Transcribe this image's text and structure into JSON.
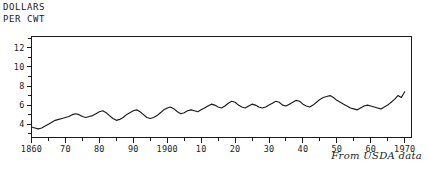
{
  "figure": {
    "axis_title_line1": "DOLLARS",
    "axis_title_line2": "PER CWT",
    "caption": "From USDA data"
  },
  "chart_data": {
    "type": "line",
    "title": "",
    "subtitle": "",
    "xlabel": "",
    "ylabel": "DOLLARS PER CWT",
    "annotations": [
      "From USDA data"
    ],
    "legend": [],
    "legend_position": "none",
    "grid": false,
    "xlim": [
      1860,
      1972
    ],
    "ylim": [
      2.6,
      13.2
    ],
    "yticks": [
      3,
      4,
      5,
      6,
      7,
      8,
      9,
      10,
      11,
      12,
      13
    ],
    "ytick_labels": [
      "",
      "4",
      "",
      "6",
      "",
      "8",
      "",
      "10",
      "",
      "12",
      ""
    ],
    "xticks": [
      1860,
      1865,
      1870,
      1875,
      1880,
      1885,
      1890,
      1895,
      1900,
      1905,
      1910,
      1915,
      1920,
      1925,
      1930,
      1935,
      1940,
      1945,
      1950,
      1955,
      1960,
      1965,
      1970
    ],
    "xtick_labels": [
      "1860",
      "",
      "70",
      "",
      "80",
      "",
      "90",
      "",
      "1900",
      "",
      "10",
      "",
      "20",
      "",
      "30",
      "",
      "40",
      "",
      "50",
      "",
      "60",
      "",
      "1970"
    ],
    "series": [
      {
        "name": "Price per hundredweight",
        "x": [
          1860,
          1861,
          1862,
          1863,
          1864,
          1865,
          1866,
          1867,
          1868,
          1869,
          1870,
          1871,
          1872,
          1873,
          1874,
          1875,
          1876,
          1877,
          1878,
          1879,
          1880,
          1881,
          1882,
          1883,
          1884,
          1885,
          1886,
          1887,
          1888,
          1889,
          1890,
          1891,
          1892,
          1893,
          1894,
          1895,
          1896,
          1897,
          1898,
          1899,
          1900,
          1901,
          1902,
          1903,
          1904,
          1905,
          1906,
          1907,
          1908,
          1909,
          1910,
          1911,
          1912,
          1913,
          1914,
          1915,
          1916,
          1917,
          1918,
          1919,
          1920,
          1921,
          1922,
          1923,
          1924,
          1925,
          1926,
          1927,
          1928,
          1929,
          1930,
          1931,
          1932,
          1933,
          1934,
          1935,
          1936,
          1937,
          1938,
          1939,
          1940,
          1941,
          1942,
          1943,
          1944,
          1945,
          1946,
          1947,
          1948,
          1949,
          1950,
          1951,
          1952,
          1953,
          1954,
          1955,
          1956,
          1957,
          1958,
          1959,
          1960,
          1961,
          1962,
          1963,
          1964,
          1965,
          1966,
          1967,
          1968,
          1969,
          1970
        ],
        "values": [
          3.7,
          3.6,
          3.5,
          3.6,
          3.8,
          4.0,
          4.2,
          4.4,
          4.5,
          4.6,
          4.7,
          4.8,
          5.0,
          5.1,
          5.0,
          4.8,
          4.7,
          4.8,
          4.9,
          5.1,
          5.3,
          5.4,
          5.2,
          4.9,
          4.6,
          4.4,
          4.5,
          4.7,
          5.0,
          5.2,
          5.4,
          5.5,
          5.3,
          5.0,
          4.7,
          4.6,
          4.7,
          4.9,
          5.2,
          5.5,
          5.7,
          5.8,
          5.6,
          5.3,
          5.1,
          5.2,
          5.4,
          5.5,
          5.4,
          5.3,
          5.5,
          5.7,
          5.9,
          6.1,
          6.0,
          5.8,
          5.7,
          5.9,
          6.2,
          6.4,
          6.3,
          6.0,
          5.8,
          5.7,
          5.9,
          6.1,
          6.0,
          5.8,
          5.7,
          5.8,
          6.0,
          6.2,
          6.4,
          6.3,
          6.0,
          5.9,
          6.1,
          6.3,
          6.5,
          6.4,
          6.1,
          5.9,
          5.8,
          6.0,
          6.3,
          6.6,
          6.8,
          6.9,
          7.0,
          6.8,
          6.5,
          6.3,
          6.1,
          5.9,
          5.7,
          5.6,
          5.5,
          5.7,
          5.9,
          6.0,
          5.9,
          5.8,
          5.7,
          5.6,
          5.8,
          6.0,
          6.3,
          6.6,
          7.0,
          6.8,
          7.4
        ]
      }
    ]
  }
}
